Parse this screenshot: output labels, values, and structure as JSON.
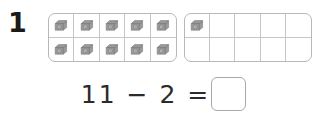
{
  "worksheet": {
    "problem_number": "1",
    "counter_icon": "grey-block-counter-icon",
    "frame_border_color": "#b8b8b8",
    "grid_line_color": "#c6c6c6",
    "counter_color": "#9a9a9a",
    "text_color": "#2b2b2b"
  },
  "ten_frames": [
    {
      "name": "first-ten-frame",
      "rows": 2,
      "columns": 5,
      "filled_count": 10,
      "cells": [
        {
          "filled": true
        },
        {
          "filled": true
        },
        {
          "filled": true
        },
        {
          "filled": true
        },
        {
          "filled": true
        },
        {
          "filled": true
        },
        {
          "filled": true
        },
        {
          "filled": true
        },
        {
          "filled": true
        },
        {
          "filled": true
        }
      ]
    },
    {
      "name": "second-ten-frame",
      "rows": 2,
      "columns": 5,
      "filled_count": 1,
      "cells": [
        {
          "filled": true
        },
        {
          "filled": false
        },
        {
          "filled": false
        },
        {
          "filled": false
        },
        {
          "filled": false
        },
        {
          "filled": false
        },
        {
          "filled": false
        },
        {
          "filled": false
        },
        {
          "filled": false
        },
        {
          "filled": false
        }
      ]
    }
  ],
  "equation": {
    "minuend": "11",
    "operator": "−",
    "subtrahend": "2",
    "equals": "=",
    "expression": "11 − 2 =",
    "answer_value": "",
    "answer_placeholder": ""
  }
}
